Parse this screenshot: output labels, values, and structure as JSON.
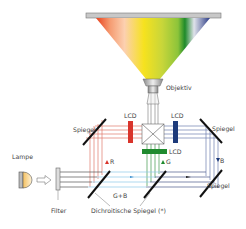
{
  "diagram": {
    "type": "3LCD projector optical path",
    "labels": {
      "objective": "Objektiv",
      "lcd_red": "LCD",
      "lcd_blue": "LCD",
      "lcd_green": "LCD",
      "mirror_left": "Spiegel",
      "mirror_right_top": "Spiegel",
      "mirror_right_bottom": "Spiegel",
      "lamp": "Lampe",
      "filter": "Filter",
      "dichroic": "Dichroitische Spiegel (*)",
      "beam_r": "R",
      "beam_g": "G",
      "beam_b": "B",
      "beam_gb": "G+B"
    },
    "colors": {
      "red": "#d9342b",
      "green": "#1f8a2e",
      "blue": "#1d3a7a",
      "beam_red": "#e07a6a",
      "beam_green": "#3f9a4a",
      "beam_blue": "#6f80b0",
      "beam_cyan": "#8cc8e8",
      "beam_white": "#555555",
      "mirror": "#111111"
    }
  }
}
